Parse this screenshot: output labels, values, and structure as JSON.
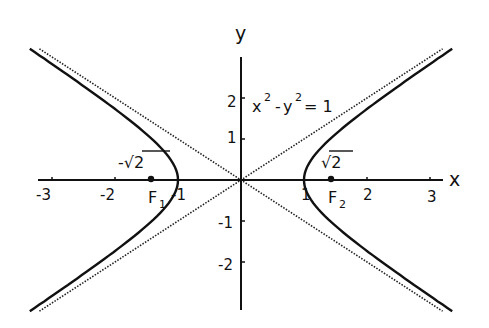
{
  "diagram": {
    "title": "",
    "equation": {
      "base_x": "x",
      "exp_x": "2",
      "minus": "-",
      "base_y": "y",
      "exp_y": "2",
      "equals": "= 1"
    },
    "axes": {
      "x_label": "x",
      "y_label": "y",
      "x_ticks": [
        "-3",
        "-2",
        "-1",
        "1",
        "2",
        "3"
      ],
      "y_ticks": [
        "2",
        "1",
        "-1",
        "-2"
      ]
    },
    "foci": [
      {
        "name": "F",
        "subscript": "1",
        "value_label": "-√2",
        "x": -1.414
      },
      {
        "name": "F",
        "subscript": "2",
        "value_label": "√2",
        "x": 1.414
      }
    ],
    "curves": {
      "hyperbola": "x^2 - y^2 = 1",
      "asymptotes": [
        "y = x",
        "y = -x"
      ],
      "asymptote_style": "dotted"
    },
    "colors": {
      "ink": "#111111",
      "background": "#ffffff"
    }
  },
  "chart_data": {
    "type": "line",
    "xlabel": "x",
    "ylabel": "y",
    "xlim": [
      -3,
      3
    ],
    "ylim": [
      -2.5,
      2.5
    ],
    "series": [
      {
        "name": "hyperbola right branch",
        "style": "solid",
        "equation": "x = sqrt(1 + y^2)"
      },
      {
        "name": "hyperbola left branch",
        "style": "solid",
        "equation": "x = -sqrt(1 + y^2)"
      },
      {
        "name": "asymptote y = x",
        "style": "dotted"
      },
      {
        "name": "asymptote y = -x",
        "style": "dotted"
      }
    ],
    "points": [
      {
        "label": "F1",
        "x": -1.414,
        "y": 0,
        "annotation": "-√2"
      },
      {
        "label": "F2",
        "x": 1.414,
        "y": 0,
        "annotation": "√2"
      }
    ],
    "x_ticks": [
      -3,
      -2,
      -1,
      1,
      2,
      3
    ],
    "y_ticks": [
      -2,
      -1,
      1,
      2
    ],
    "grid": false
  }
}
